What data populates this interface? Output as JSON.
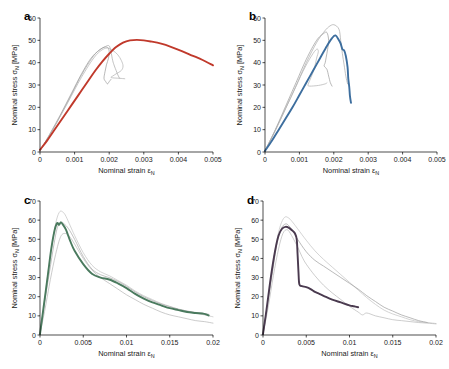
{
  "figure": {
    "type": "multi-panel-line-chart",
    "panel_count": 4,
    "layout": "2x2",
    "background": "#ffffff"
  },
  "axis_titles": {
    "x_prefix": "Nominal strain ",
    "x_symbol": "ε",
    "x_subscript": "N",
    "y_prefix": "Nominal stress ",
    "y_symbol": "σ",
    "y_subscript": "N",
    "y_suffix": " [MPa]"
  },
  "panels": [
    {
      "letter": "a",
      "accent_color": "#c0392b",
      "x_ticks": [
        "0",
        "0.001",
        "0.002",
        "0.003",
        "0.004",
        "0.005"
      ],
      "y_ticks": [
        "0",
        "10",
        "20",
        "30",
        "40",
        "50",
        "60"
      ]
    },
    {
      "letter": "b",
      "accent_color": "#3d6e9e",
      "x_ticks": [
        "0",
        "0.001",
        "0.002",
        "0.003",
        "0.004",
        "0.005"
      ],
      "y_ticks": [
        "0",
        "10",
        "20",
        "30",
        "40",
        "50",
        "60"
      ]
    },
    {
      "letter": "c",
      "accent_color": "#4a7a5e",
      "x_ticks": [
        "0",
        "0.005",
        "0.01",
        "0.015",
        "0.02"
      ],
      "y_ticks": [
        "0",
        "10",
        "20",
        "30",
        "40",
        "50",
        "60",
        "70"
      ]
    },
    {
      "letter": "d",
      "accent_color": "#4a3a4f",
      "x_ticks": [
        "0",
        "0.005",
        "0.01",
        "0.015",
        "0.02"
      ],
      "y_ticks": [
        "0",
        "10",
        "20",
        "30",
        "40",
        "50",
        "60",
        "70"
      ]
    }
  ],
  "chart_data": [
    {
      "type": "line",
      "panel": "a",
      "title": "",
      "xlabel": "Nominal strain εN",
      "ylabel": "Nominal stress σN [MPa]",
      "xlim": [
        0,
        0.005
      ],
      "ylim": [
        0,
        60
      ],
      "xticks": [
        0,
        0.001,
        0.002,
        0.003,
        0.004,
        0.005
      ],
      "yticks": [
        0,
        10,
        20,
        30,
        40,
        50,
        60
      ],
      "grid": false,
      "legend": "none",
      "series": [
        {
          "name": "mean-red",
          "color": "#c0392b",
          "width": 1.9,
          "x": [
            0,
            0.0002,
            0.0004,
            0.0006,
            0.0008,
            0.001,
            0.0012,
            0.0014,
            0.0016,
            0.0018,
            0.002,
            0.0022,
            0.0024,
            0.0026,
            0.0028,
            0.003,
            0.0032,
            0.0035,
            0.0038,
            0.0041,
            0.0044,
            0.0047,
            0.005
          ],
          "y": [
            1.0,
            5.0,
            9.5,
            14.0,
            18.5,
            23.0,
            27.5,
            32.0,
            36.5,
            40.5,
            44.0,
            47.0,
            49.0,
            50.0,
            50.2,
            50.0,
            49.5,
            48.5,
            47.0,
            45.2,
            43.2,
            41.2,
            38.8
          ]
        },
        {
          "name": "specimen-1-gray",
          "color": "#a8a8a8",
          "width": 0.7,
          "x": [
            0,
            0.0003,
            0.0006,
            0.0009,
            0.0012,
            0.0015,
            0.0017,
            0.0019,
            0.002,
            0.00205,
            0.0021,
            0.00215,
            0.0022,
            0.00225,
            0.0023
          ],
          "y": [
            0.5,
            8.0,
            16.5,
            25.5,
            34.5,
            42.0,
            45.5,
            47.3,
            47.5,
            45.0,
            41.0,
            38.5,
            36.5,
            34.5,
            33.0
          ]
        },
        {
          "name": "specimen-2-gray",
          "color": "#9a9a9a",
          "width": 0.7,
          "x": [
            0,
            0.0003,
            0.0006,
            0.0009,
            0.0012,
            0.0015,
            0.0018,
            0.00195,
            0.002,
            0.00198,
            0.00192,
            0.00188,
            0.00185,
            0.0019,
            0.00195,
            0.002,
            0.00205
          ],
          "y": [
            0.5,
            8.5,
            17.0,
            26.0,
            35.0,
            42.5,
            46.5,
            46.8,
            45.0,
            42.0,
            39.0,
            36.0,
            33.0,
            31.5,
            30.5,
            31.5,
            32.5
          ]
        },
        {
          "name": "specimen-3-gray",
          "color": "#b0b0b0",
          "width": 0.7,
          "x": [
            0,
            0.0004,
            0.0008,
            0.0012,
            0.0016,
            0.0019,
            0.0021,
            0.00225,
            0.00235,
            0.0024,
            0.00235,
            0.0022,
            0.0021,
            0.00205,
            0.0021,
            0.0023,
            0.00245
          ],
          "y": [
            0.5,
            11.0,
            22.0,
            33.5,
            43.0,
            46.5,
            45.5,
            43.5,
            41.0,
            38.5,
            36.5,
            35.0,
            34.0,
            33.5,
            33.2,
            33.0,
            32.8
          ]
        }
      ]
    },
    {
      "type": "line",
      "panel": "b",
      "title": "",
      "xlabel": "Nominal strain εN",
      "ylabel": "Nominal stress σN [MPa]",
      "xlim": [
        0,
        0.005
      ],
      "ylim": [
        0,
        60
      ],
      "xticks": [
        0,
        0.001,
        0.002,
        0.003,
        0.004,
        0.005
      ],
      "yticks": [
        0,
        10,
        20,
        30,
        40,
        50,
        60
      ],
      "grid": false,
      "legend": "none",
      "series": [
        {
          "name": "mean-blue",
          "color": "#3d6e9e",
          "width": 1.9,
          "x": [
            0,
            0.0002,
            0.0004,
            0.0006,
            0.0008,
            0.001,
            0.0012,
            0.0014,
            0.0016,
            0.0018,
            0.00195,
            0.00205,
            0.00215,
            0.0022,
            0.00225,
            0.0023,
            0.00235,
            0.0024,
            0.00242,
            0.00245,
            0.00247,
            0.0025
          ],
          "y": [
            0.5,
            5.0,
            10.0,
            15.0,
            20.0,
            25.5,
            31.0,
            36.5,
            42.0,
            47.5,
            51.0,
            52.2,
            50.0,
            48.5,
            46.0,
            45.5,
            43.0,
            38.0,
            33.0,
            29.0,
            25.0,
            22.0
          ]
        },
        {
          "name": "specimen-1-gray",
          "color": "#a8a8a8",
          "width": 0.7,
          "x": [
            0,
            0.0003,
            0.0006,
            0.0009,
            0.0012,
            0.0015,
            0.0017,
            0.00185,
            0.002,
            0.00215,
            0.0022,
            0.00225,
            0.0023,
            0.00235,
            0.0024
          ],
          "y": [
            0.5,
            9.5,
            19.5,
            29.5,
            40.0,
            49.0,
            53.5,
            56.0,
            57.0,
            55.0,
            50.0,
            44.0,
            39.0,
            34.0,
            30.5
          ]
        },
        {
          "name": "specimen-2-gray",
          "color": "#9a9a9a",
          "width": 0.7,
          "x": [
            0,
            0.0003,
            0.0006,
            0.0009,
            0.0012,
            0.0015,
            0.0017,
            0.0018,
            0.00185,
            0.00182,
            0.00178,
            0.00175,
            0.00172,
            0.0018,
            0.00185,
            0.0019,
            0.00195
          ],
          "y": [
            0.5,
            10.0,
            20.5,
            31.0,
            41.5,
            50.0,
            53.0,
            53.5,
            50.0,
            46.0,
            42.5,
            40.0,
            38.5,
            37.0,
            34.0,
            31.0,
            29.5
          ]
        },
        {
          "name": "specimen-3-gray",
          "color": "#b0b0b0",
          "width": 0.7,
          "x": [
            0,
            0.0004,
            0.0008,
            0.0011,
            0.00135,
            0.0015,
            0.00155,
            0.0015,
            0.00145,
            0.00138,
            0.0013,
            0.00125,
            0.0013,
            0.00155,
            0.00175,
            0.0018
          ],
          "y": [
            0.5,
            13.0,
            26.0,
            36.0,
            43.0,
            46.0,
            45.0,
            42.0,
            38.5,
            35.0,
            32.0,
            30.0,
            29.5,
            29.8,
            30.5,
            31.0
          ]
        }
      ]
    },
    {
      "type": "line",
      "panel": "c",
      "title": "",
      "xlabel": "Nominal strain εN",
      "ylabel": "Nominal stress σN [MPa]",
      "xlim": [
        0,
        0.02
      ],
      "ylim": [
        0,
        70
      ],
      "xticks": [
        0,
        0.005,
        0.01,
        0.015,
        0.02
      ],
      "yticks": [
        0,
        10,
        20,
        30,
        40,
        50,
        60,
        70
      ],
      "grid": false,
      "legend": "none",
      "series": [
        {
          "name": "mean-green",
          "color": "#4a7a5e",
          "width": 1.9,
          "x": [
            0,
            0.0004,
            0.0009,
            0.0013,
            0.0017,
            0.002,
            0.0022,
            0.0024,
            0.0026,
            0.003,
            0.0035,
            0.004,
            0.005,
            0.006,
            0.007,
            0.008,
            0.009,
            0.01,
            0.011,
            0.012,
            0.013,
            0.014,
            0.015,
            0.016,
            0.017,
            0.018,
            0.019,
            0.0195
          ],
          "y": [
            0.5,
            14.0,
            31.0,
            45.0,
            55.0,
            58.5,
            57.5,
            58.8,
            58.0,
            55.0,
            49.0,
            44.0,
            37.0,
            32.0,
            30.0,
            29.0,
            27.0,
            24.5,
            21.5,
            19.0,
            17.0,
            15.5,
            14.0,
            13.0,
            12.0,
            11.5,
            11.0,
            10.2
          ]
        },
        {
          "name": "specimen-1-gray",
          "color": "#c2c2c2",
          "width": 0.7,
          "x": [
            0,
            0.0005,
            0.001,
            0.0015,
            0.0019,
            0.0023,
            0.0027,
            0.003,
            0.0035,
            0.004,
            0.005,
            0.006,
            0.007,
            0.008,
            0.009,
            0.01,
            0.011,
            0.012,
            0.013,
            0.014,
            0.015,
            0.016,
            0.017,
            0.018,
            0.019,
            0.02
          ],
          "y": [
            0.5,
            17.0,
            35.0,
            50.0,
            60.0,
            64.5,
            64.0,
            62.0,
            57.0,
            52.0,
            43.0,
            36.5,
            33.0,
            31.0,
            28.5,
            26.0,
            23.0,
            20.5,
            18.5,
            16.5,
            15.0,
            13.5,
            12.5,
            11.5,
            10.5,
            9.5
          ]
        },
        {
          "name": "specimen-2-gray",
          "color": "#b4b4b4",
          "width": 0.7,
          "x": [
            0,
            0.0006,
            0.0012,
            0.0018,
            0.0024,
            0.003,
            0.0035,
            0.004,
            0.005,
            0.006,
            0.007,
            0.008,
            0.009,
            0.01,
            0.011,
            0.012,
            0.013,
            0.014,
            0.015,
            0.016,
            0.017,
            0.018,
            0.019,
            0.02
          ],
          "y": [
            0.5,
            14.0,
            29.0,
            42.0,
            51.5,
            53.0,
            51.0,
            47.5,
            40.0,
            34.0,
            30.0,
            27.0,
            24.0,
            21.0,
            18.5,
            16.0,
            14.0,
            12.0,
            10.5,
            9.5,
            8.5,
            7.5,
            7.0,
            6.2
          ]
        },
        {
          "name": "specimen-3-gray",
          "color": "#a8a8a8",
          "width": 0.7,
          "x": [
            0,
            0.0005,
            0.0011,
            0.0016,
            0.002,
            0.0024,
            0.0028,
            0.0033,
            0.004,
            0.005,
            0.006,
            0.007,
            0.008,
            0.009,
            0.01,
            0.011,
            0.012,
            0.013,
            0.014,
            0.015,
            0.016,
            0.017,
            0.018,
            0.019,
            0.0195
          ],
          "y": [
            0.5,
            16.0,
            33.0,
            47.0,
            56.0,
            59.0,
            58.0,
            55.5,
            50.0,
            41.0,
            34.5,
            31.5,
            30.0,
            28.0,
            25.5,
            22.5,
            20.0,
            18.0,
            16.2,
            14.8,
            13.5,
            12.5,
            11.8,
            11.2,
            10.8
          ]
        }
      ]
    },
    {
      "type": "line",
      "panel": "d",
      "title": "",
      "xlabel": "Nominal strain εN",
      "ylabel": "Nominal stress σN [MPa]",
      "xlim": [
        0,
        0.02
      ],
      "ylim": [
        0,
        70
      ],
      "xticks": [
        0,
        0.005,
        0.01,
        0.015,
        0.02
      ],
      "yticks": [
        0,
        10,
        20,
        30,
        40,
        50,
        60,
        70
      ],
      "grid": false,
      "legend": "none",
      "series": [
        {
          "name": "mean-purple",
          "color": "#4a3a4f",
          "width": 1.9,
          "x": [
            0,
            0.0004,
            0.0009,
            0.0014,
            0.0018,
            0.0022,
            0.0026,
            0.003,
            0.0034,
            0.0037,
            0.0039,
            0.004,
            0.0041,
            0.0042,
            0.0045,
            0.005,
            0.0055,
            0.006,
            0.0065,
            0.007,
            0.008,
            0.009,
            0.01,
            0.0105,
            0.011
          ],
          "y": [
            0.5,
            13.0,
            30.0,
            44.0,
            52.0,
            55.5,
            56.5,
            56.0,
            54.5,
            53.0,
            50.0,
            42.0,
            33.0,
            26.5,
            25.5,
            25.0,
            24.0,
            22.5,
            21.5,
            20.5,
            18.5,
            17.0,
            15.5,
            15.0,
            14.5
          ]
        },
        {
          "name": "specimen-1-gray",
          "color": "#c2c2c2",
          "width": 0.7,
          "x": [
            0,
            0.0005,
            0.001,
            0.0015,
            0.002,
            0.0025,
            0.003,
            0.0035,
            0.004,
            0.005,
            0.006,
            0.007,
            0.008,
            0.009,
            0.01,
            0.011,
            0.012,
            0.013,
            0.014,
            0.015,
            0.016,
            0.017,
            0.018,
            0.019,
            0.02
          ],
          "y": [
            0.5,
            15.0,
            32.0,
            47.0,
            57.0,
            61.5,
            61.0,
            58.5,
            55.5,
            49.5,
            44.0,
            39.5,
            35.5,
            31.5,
            27.5,
            23.5,
            19.5,
            16.0,
            13.0,
            11.0,
            9.5,
            8.0,
            7.0,
            6.5,
            6.0
          ]
        },
        {
          "name": "specimen-2-gray",
          "color": "#9c9c9c",
          "width": 0.7,
          "x": [
            0,
            0.0005,
            0.0011,
            0.0016,
            0.0021,
            0.0026,
            0.003,
            0.0035,
            0.004,
            0.005,
            0.006,
            0.007,
            0.008,
            0.009,
            0.01,
            0.011,
            0.012,
            0.013,
            0.014,
            0.015,
            0.016,
            0.017,
            0.018,
            0.019
          ],
          "y": [
            0.5,
            15.5,
            33.0,
            47.5,
            55.5,
            58.0,
            57.0,
            54.0,
            50.0,
            43.5,
            39.0,
            36.0,
            33.0,
            30.0,
            27.0,
            24.0,
            20.5,
            17.5,
            14.5,
            12.5,
            10.5,
            9.0,
            7.5,
            6.5
          ]
        },
        {
          "name": "specimen-3-gray",
          "color": "#b8b8b8",
          "width": 0.7,
          "x": [
            0,
            0.0006,
            0.0012,
            0.0018,
            0.0023,
            0.0028,
            0.0033,
            0.004,
            0.0045,
            0.005,
            0.006,
            0.007,
            0.008,
            0.009,
            0.01,
            0.011,
            0.0115,
            0.012,
            0.013,
            0.014,
            0.015,
            0.016,
            0.017,
            0.018,
            0.019,
            0.02
          ],
          "y": [
            0.5,
            14.5,
            31.0,
            45.0,
            53.0,
            55.0,
            52.0,
            46.0,
            41.0,
            37.0,
            31.0,
            26.0,
            22.0,
            18.5,
            15.0,
            12.0,
            10.5,
            11.5,
            10.0,
            9.0,
            8.0,
            7.5,
            7.0,
            6.5,
            6.2,
            5.8
          ]
        }
      ]
    }
  ]
}
